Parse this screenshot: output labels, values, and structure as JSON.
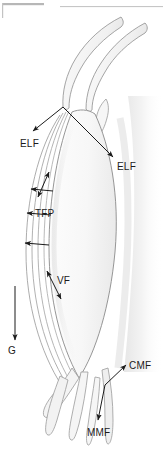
{
  "figure": {
    "type": "anatomical-line-diagram",
    "width": 163,
    "height": 452,
    "background_color": "#ffffff",
    "line_color": "#6f6f6f",
    "arrow_color": "#1b1b1b",
    "fill_light": "#fbfbfb",
    "fill_mid": "#f1f1f1",
    "shadow_color": "#c9c9c9"
  },
  "header_rules": [
    {
      "name": "rule-left",
      "x": 2,
      "y": 3,
      "width": 42,
      "height": 2,
      "color": "#b4b4b4"
    },
    {
      "name": "rule-right",
      "x": 60,
      "y": 6,
      "width": 103,
      "height": 1,
      "color": "#c2c2c2"
    },
    {
      "name": "tick-left",
      "x": 2,
      "y": 3,
      "width": 1,
      "height": 14,
      "color": "#bfbfbf"
    }
  ],
  "labels": [
    {
      "id": "elf-left",
      "text": "ELF",
      "x": 20,
      "y": 139
    },
    {
      "id": "elf-right",
      "text": "ELF",
      "x": 117,
      "y": 162
    },
    {
      "id": "tfp",
      "text": "TFP",
      "x": 35,
      "y": 209
    },
    {
      "id": "vf",
      "text": "VF",
      "x": 57,
      "y": 276
    },
    {
      "id": "g",
      "text": "G",
      "x": 8,
      "y": 346
    },
    {
      "id": "cmf",
      "text": "CMF",
      "x": 129,
      "y": 361
    },
    {
      "id": "mmf",
      "text": "MMF",
      "x": 87,
      "y": 428
    }
  ],
  "leaders": [
    {
      "id": "leader-elf-left",
      "from": [
        63,
        107
      ],
      "to": [
        32,
        132
      ],
      "heads": "end"
    },
    {
      "id": "leader-elf-right",
      "from": [
        63,
        107
      ],
      "to": [
        114,
        158
      ],
      "heads": "end"
    },
    {
      "id": "leader-tfp-upper",
      "from": [
        52,
        192
      ],
      "to": [
        30,
        189
      ],
      "heads": "end"
    },
    {
      "id": "leader-tfp-lower",
      "from": [
        50,
        215
      ],
      "to": [
        26,
        213
      ],
      "heads": "end"
    },
    {
      "id": "leader-tfp-third",
      "from": [
        48,
        245
      ],
      "to": [
        24,
        243
      ],
      "heads": "end"
    },
    {
      "id": "leader-elf-gap",
      "from": [
        49,
        171
      ],
      "to": [
        37,
        197
      ],
      "heads": "both"
    },
    {
      "id": "leader-vf",
      "from": [
        46,
        270
      ],
      "to": [
        62,
        300
      ],
      "heads": "both"
    },
    {
      "id": "leader-g",
      "from": [
        15,
        286
      ],
      "to": [
        15,
        341
      ],
      "heads": "end"
    },
    {
      "id": "leader-cmf",
      "from": [
        105,
        385
      ],
      "to": [
        127,
        364
      ],
      "heads": "end"
    },
    {
      "id": "leader-mmf",
      "from": [
        105,
        385
      ],
      "to": [
        97,
        421
      ],
      "heads": "end"
    }
  ],
  "structures": [
    {
      "id": "superior-process",
      "name": "upper tapering process"
    },
    {
      "id": "vocal-body",
      "name": "lens shaped body"
    },
    {
      "id": "layer-outer",
      "name": "outer lamina arc"
    },
    {
      "id": "layer-middle",
      "name": "middle lamina arc"
    },
    {
      "id": "layer-inner",
      "name": "inner lamina arc"
    },
    {
      "id": "inferior-process",
      "name": "lower tapering process"
    },
    {
      "id": "lateral-shadow",
      "name": "lateral gradient band"
    }
  ]
}
